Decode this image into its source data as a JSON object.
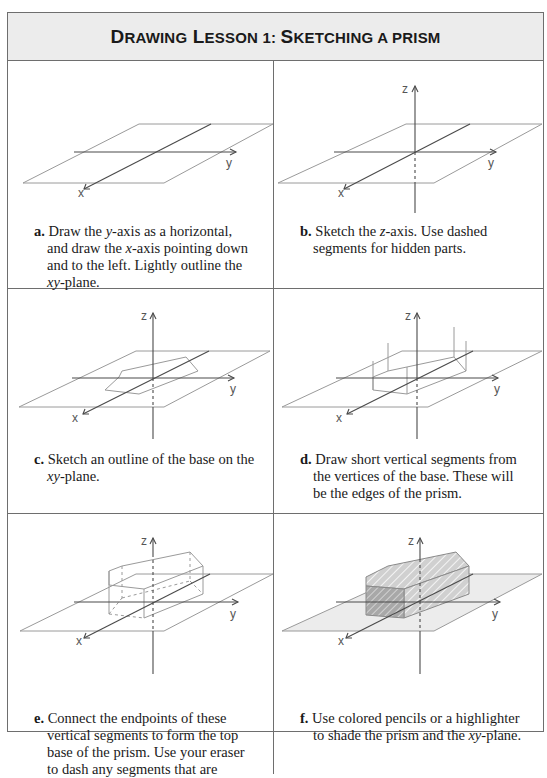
{
  "title": {
    "lead": "D",
    "w1": "RAWING",
    "l2": "L",
    "w2": "ESSON 1: ",
    "l3": "S",
    "w3": "KETCHING A PRISM",
    "full": "Drawing Lesson 1: Sketching a prism"
  },
  "axis_labels": {
    "x": "x",
    "y": "y",
    "z": "z"
  },
  "steps": [
    {
      "letter": "a.",
      "parts": [
        "Draw the ",
        "y",
        "-axis as a horizontal, and draw the ",
        "x",
        "-axis pointing down and to the left. Lightly outline the ",
        "xy",
        "-plane."
      ]
    },
    {
      "letter": "b.",
      "parts": [
        "Sketch the ",
        "z",
        "-axis. Use dashed segments for hidden parts."
      ]
    },
    {
      "letter": "c.",
      "parts": [
        "Sketch an outline of the base on the ",
        "xy",
        "-plane."
      ]
    },
    {
      "letter": "d.",
      "parts": [
        "Draw short vertical segments from the vertices of the base. These will be the edges of the prism."
      ]
    },
    {
      "letter": "e.",
      "parts": [
        "Connect the endpoints of these vertical segments to form the top base of the prism. Use your eraser to dash any segments that are"
      ]
    },
    {
      "letter": "f.",
      "parts": [
        "Use colored pencils or a highlighter to shade the prism and the ",
        "xy",
        "-plane."
      ]
    }
  ],
  "colors": {
    "border": "#6e6e6e",
    "header_bg": "#ececec",
    "plane_line": "#9a9a9a",
    "axis_line": "#4a4a4a",
    "shade": "#d9d9d9"
  }
}
